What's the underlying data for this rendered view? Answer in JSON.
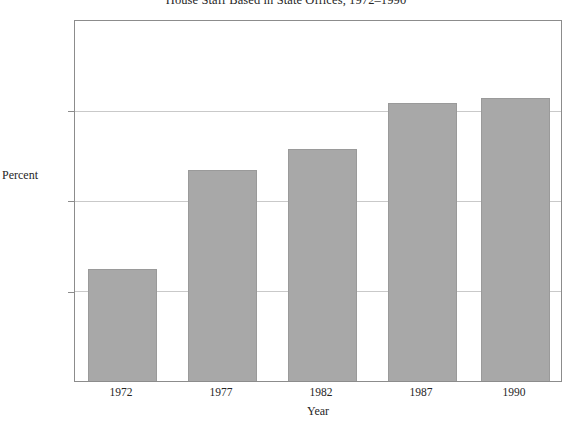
{
  "chart_data": {
    "type": "bar",
    "title": "House Staff Based in State Offices, 1972–1990",
    "xlabel": "Year",
    "ylabel": "Percent",
    "categories": [
      "1972",
      "1977",
      "1982",
      "1987",
      "1990"
    ],
    "values": [
      22.4,
      33.4,
      35.8,
      40.9,
      41.5
    ],
    "ylim": [
      10,
      50
    ],
    "yticks": [
      "10",
      "20",
      "30",
      "40",
      "50"
    ],
    "ytick_values": [
      10,
      20,
      30,
      40,
      50
    ],
    "grid": true,
    "gridlines_at": [
      20,
      30,
      40
    ],
    "legend": null,
    "bar_color": "#a8a8a8",
    "bar_edge_color": "#9a9a9a",
    "axis_color": "#8c8c8c",
    "grid_color": "#c9c9c9",
    "background": "#ffffff"
  }
}
